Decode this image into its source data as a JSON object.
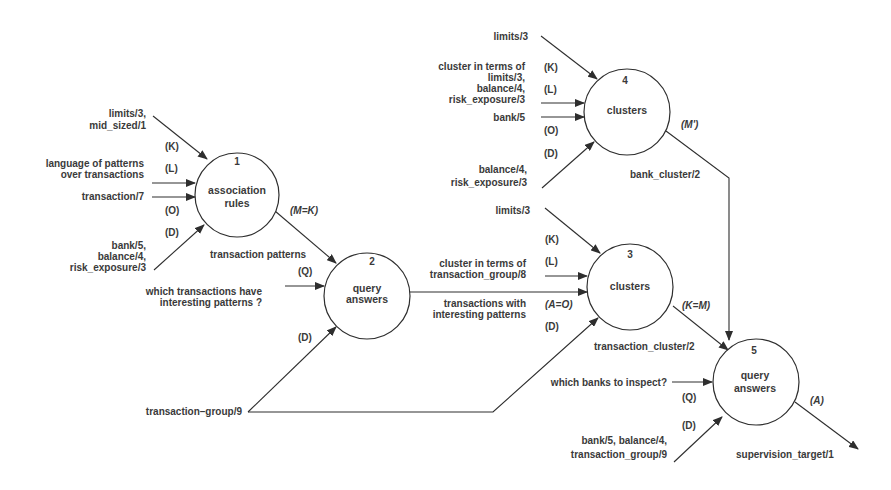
{
  "colors": {
    "line": "#2e2e2e",
    "text": "#3a3a3a",
    "background": "#ffffff"
  },
  "nodes": [
    {
      "id": "1",
      "number": "1",
      "title": [
        "association",
        "rules"
      ]
    },
    {
      "id": "2",
      "number": "2",
      "title": [
        "query",
        "answers"
      ]
    },
    {
      "id": "3",
      "number": "3",
      "title": [
        "clusters"
      ]
    },
    {
      "id": "4",
      "number": "4",
      "title": [
        "clusters"
      ]
    },
    {
      "id": "5",
      "number": "5",
      "title": [
        "query",
        "answers"
      ]
    }
  ],
  "node1_inputs": {
    "k": {
      "tag": "(K)",
      "label": [
        "limits/3,",
        "mid_sized/1"
      ]
    },
    "l": {
      "tag": "(L)",
      "label": [
        "language of patterns",
        "over transactions"
      ]
    },
    "o": {
      "tag": "(O)",
      "label": [
        "transaction/7"
      ]
    },
    "d": {
      "tag": "(D)",
      "label": [
        "bank/5,",
        "balance/4,",
        "risk_exposure/3"
      ]
    },
    "out_tag": "(M=K)",
    "out_label": "transaction patterns"
  },
  "node2_inputs": {
    "q": {
      "tag": "(Q)",
      "label": [
        "which transactions have",
        "interesting patterns ?"
      ]
    },
    "d": {
      "tag": "(D)",
      "label": [
        "transaction–group/9"
      ]
    }
  },
  "node3_inputs": {
    "k": {
      "tag": "(K)",
      "label": [
        "limits/3"
      ]
    },
    "l": {
      "tag": "(L)",
      "label": [
        "cluster in terms of",
        "transaction_group/8"
      ]
    },
    "o": {
      "tag": "(A=O)",
      "label": [
        "transactions with",
        "interesting patterns"
      ]
    },
    "d": {
      "tag": "(D)"
    },
    "out_tag": "(K=M)",
    "out_label": "transaction_cluster/2"
  },
  "node4_inputs": {
    "k": {
      "tag": "(K)",
      "label": [
        "limits/3"
      ]
    },
    "l": {
      "tag": "(L)",
      "label": [
        "cluster in terms of",
        "limits/3,",
        "balance/4,",
        "risk_exposure/3"
      ]
    },
    "o": {
      "tag": "(O)",
      "label": [
        "bank/5"
      ]
    },
    "d": {
      "tag": "(D)",
      "label": [
        "balance/4,",
        "risk_exposure/3"
      ]
    },
    "out_tag": "(M')",
    "out_label": "bank_cluster/2"
  },
  "node5_inputs": {
    "q": {
      "tag": "(Q)",
      "label": [
        "which banks to inspect?"
      ]
    },
    "d": {
      "tag": "(D)",
      "label": [
        "bank/5, balance/4,",
        "transaction_group/9"
      ]
    },
    "out_tag": "(A)",
    "out_label": "supervision_target/1"
  }
}
